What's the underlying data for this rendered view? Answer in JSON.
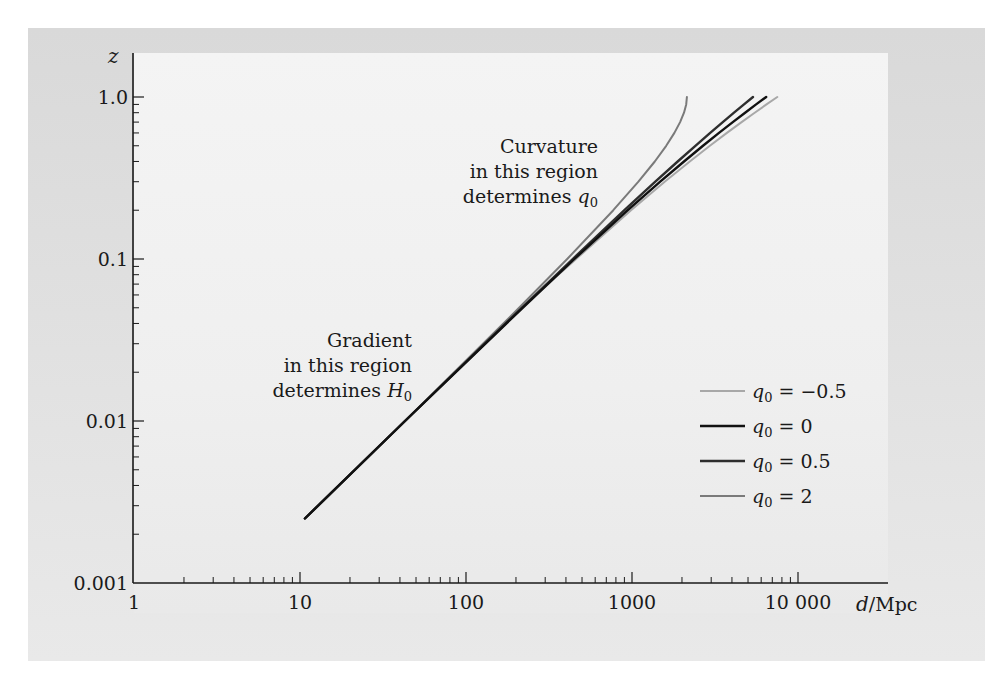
{
  "chart_data": {
    "type": "line",
    "title": "",
    "xlabel": "d/Mpc",
    "ylabel": "z",
    "xscale": "log",
    "yscale": "log",
    "xlim": [
      1,
      30000
    ],
    "ylim": [
      0.001,
      1.6
    ],
    "grid": false,
    "x_ticks": [
      1,
      10,
      100,
      1000,
      10000
    ],
    "x_tick_labels": [
      "1",
      "10",
      "100",
      "1000",
      "10 000"
    ],
    "y_ticks": [
      0.001,
      0.01,
      0.1,
      1.0
    ],
    "y_tick_labels": [
      "0.001",
      "0.01",
      "0.1",
      "1.0"
    ],
    "legend_position": "lower right",
    "series": [
      {
        "name": "q0 = -0.5",
        "label_var": "q",
        "label_sub": "0",
        "label_rhs": " = −0.5",
        "color": "#a8a8a8",
        "width": 2,
        "points": [
          [
            10.7,
            0.0025
          ],
          [
            42.9,
            0.01
          ],
          [
            215,
            0.05
          ],
          [
            460.7,
            0.1
          ],
          [
            985.8,
            0.2
          ],
          [
            1575,
            0.3
          ],
          [
            2228.7,
            0.4
          ],
          [
            2946.6,
            0.5
          ],
          [
            3728.8,
            0.6
          ],
          [
            4575.3,
            0.7
          ],
          [
            5486.1,
            0.8
          ],
          [
            6461.1,
            0.9
          ],
          [
            7500.5,
            1.0
          ]
        ]
      },
      {
        "name": "q0 = 0",
        "label_var": "q",
        "label_sub": "0",
        "label_rhs": " = 0",
        "color": "#111111",
        "width": 2.4,
        "points": [
          [
            10.7,
            0.0025
          ],
          [
            42.9,
            0.01
          ],
          [
            219.7,
            0.05
          ],
          [
            450,
            0.1
          ],
          [
            942.9,
            0.2
          ],
          [
            1478.7,
            0.3
          ],
          [
            2057.3,
            0.4
          ],
          [
            2678.8,
            0.5
          ],
          [
            3343.1,
            0.6
          ],
          [
            4050.3,
            0.7
          ],
          [
            4800.3,
            0.8
          ],
          [
            5593.2,
            0.9
          ],
          [
            6429,
            1.0
          ]
        ]
      },
      {
        "name": "q0 = 0.5",
        "label_var": "q",
        "label_sub": "0",
        "label_rhs": " = 0.5",
        "color": "#2e2e2e",
        "width": 2.4,
        "points": [
          [
            10.7,
            0.0025
          ],
          [
            42.9,
            0.01
          ],
          [
            216.9,
            0.05
          ],
          [
            439.3,
            0.1
          ],
          [
            900.1,
            0.2
          ],
          [
            1382.2,
            0.3
          ],
          [
            1885.8,
            0.4
          ],
          [
            2410.9,
            0.5
          ],
          [
            2957.3,
            0.6
          ],
          [
            3525.2,
            0.7
          ],
          [
            4114.6,
            0.8
          ],
          [
            4725.3,
            0.9
          ],
          [
            5357.5,
            1.0
          ]
        ]
      },
      {
        "name": "q0 = 2",
        "label_var": "q",
        "label_sub": "0",
        "label_rhs": " = 2",
        "color": "#7a7a7a",
        "width": 2,
        "points": [
          [
            10.7,
            0.0025
          ],
          [
            42.9,
            0.01
          ],
          [
            209,
            0.05
          ],
          [
            407.2,
            0.1
          ],
          [
            771.5,
            0.2
          ],
          [
            1092.9,
            0.3
          ],
          [
            1371.5,
            0.4
          ],
          [
            1607.3,
            0.5
          ],
          [
            1800.1,
            0.6
          ],
          [
            1950.1,
            0.7
          ],
          [
            2057.3,
            0.8
          ],
          [
            2121.6,
            0.9
          ],
          [
            2143,
            1.0
          ]
        ]
      }
    ],
    "annotations": [
      {
        "lines": [
          "Curvature",
          "in this region",
          "determines q0"
        ],
        "text_var": "q",
        "text_sub": "0",
        "anchor": "upper middle"
      },
      {
        "lines": [
          "Gradient",
          "in this region",
          "determines H0"
        ],
        "text_var": "H",
        "text_sub": "0",
        "anchor": "lower left"
      }
    ]
  },
  "axes": {
    "ylabel": "z",
    "xlabel_var": "d",
    "xlabel_unit": "/Mpc"
  },
  "annotations": {
    "curvature": {
      "line1": "Curvature",
      "line2": "in this region",
      "line3_prefix": "determines ",
      "var": "q",
      "sub": "0"
    },
    "gradient": {
      "line1": "Gradient",
      "line2": "in this region",
      "line3_prefix": "determines ",
      "var": "H",
      "sub": "0"
    }
  },
  "layout": {
    "x0_px": 134,
    "decade_px": 166,
    "y_axis_px": 583,
    "y_decade_px": 162,
    "y_min_exp": -3,
    "plot_right_px": 888,
    "plot_top_px": 53
  }
}
